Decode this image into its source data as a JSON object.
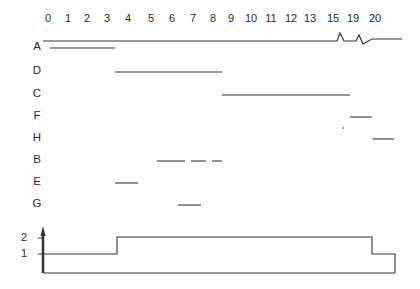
{
  "diagram": {
    "type": "gantt-timeline-with-resource-profile",
    "time_axis": {
      "ticks": [
        {
          "label": "0",
          "x": 48
        },
        {
          "label": "1",
          "x": 68
        },
        {
          "label": "2",
          "x": 87
        },
        {
          "label": "3",
          "x": 107
        },
        {
          "label": "4",
          "x": 128
        },
        {
          "label": "5",
          "x": 151
        },
        {
          "label": "6",
          "x": 172
        },
        {
          "label": "7",
          "x": 193
        },
        {
          "label": "8",
          "x": 213
        },
        {
          "label": "9",
          "x": 231
        },
        {
          "label": "10",
          "x": 251
        },
        {
          "label": "11",
          "x": 271
        },
        {
          "label": "12",
          "x": 291
        },
        {
          "label": "13",
          "x": 310
        },
        {
          "label": "15",
          "x": 333
        },
        {
          "label": "19",
          "x": 353
        },
        {
          "label": "20",
          "x": 375
        }
      ],
      "axis_break_note": "zigzag breaks between 13–15 and 15–19"
    },
    "tasks": [
      {
        "label": "A",
        "y": 46,
        "segments": [
          [
            50,
            115
          ]
        ]
      },
      {
        "label": "D",
        "y": 70,
        "segments": [
          [
            115,
            222
          ]
        ]
      },
      {
        "label": "C",
        "y": 93,
        "segments": [
          [
            222,
            350
          ]
        ]
      },
      {
        "label": "F",
        "y": 115,
        "segments": [
          [
            350,
            372
          ]
        ],
        "marks": [
          [
            342,
            344,
            128
          ]
        ]
      },
      {
        "label": "H",
        "y": 137,
        "segments": [
          [
            373,
            394
          ]
        ]
      },
      {
        "label": "B",
        "y": 159,
        "segments": [
          [
            157,
            185
          ],
          [
            191,
            206
          ],
          [
            212,
            222
          ]
        ]
      },
      {
        "label": "E",
        "y": 181,
        "segments": [
          [
            115,
            138
          ]
        ]
      },
      {
        "label": "G",
        "y": 203,
        "segments": [
          [
            178,
            201
          ]
        ]
      }
    ],
    "resource_profile": {
      "y_ticks": [
        {
          "label": "2",
          "y": 238
        },
        {
          "label": "1",
          "y": 254
        }
      ],
      "steps": [
        {
          "from_time": "0",
          "to_time": "4",
          "level": 1
        },
        {
          "from_time": "4",
          "to_time": "20",
          "level": 2
        },
        {
          "from_time": "20",
          "to_time": "end",
          "level": 1
        }
      ]
    }
  }
}
